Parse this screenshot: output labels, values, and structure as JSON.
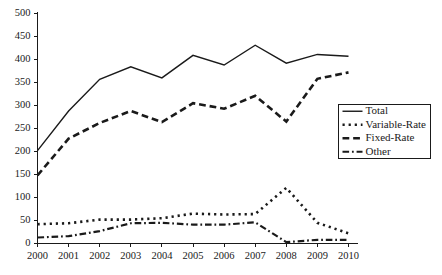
{
  "chart_data": {
    "type": "line",
    "title": "",
    "subtitle": "",
    "xlabel": "",
    "ylabel": "",
    "categories": [
      "2000",
      "2001",
      "2002",
      "2003",
      "2004",
      "2005",
      "2006",
      "2007",
      "2008",
      "2009",
      "2010"
    ],
    "x": [
      2000,
      2001,
      2002,
      2003,
      2004,
      2005,
      2006,
      2007,
      2008,
      2009,
      2010
    ],
    "ylim": [
      0,
      500
    ],
    "xlim": [
      2000,
      2010
    ],
    "yticks": [
      0,
      50,
      100,
      150,
      200,
      250,
      300,
      350,
      400,
      450,
      500
    ],
    "ytick_labels": [
      "0",
      "50",
      "100",
      "150",
      "200",
      "250",
      "300",
      "350",
      "400",
      "450",
      "500"
    ],
    "grid": false,
    "legend_position": "right",
    "series": [
      {
        "name": "Total",
        "dash": "solid",
        "width": 1.4,
        "color": "#1a1a1a",
        "values": [
          202,
          288,
          357,
          384,
          360,
          409,
          388,
          431,
          392,
          411,
          407
        ]
      },
      {
        "name": "Variable-Rate",
        "dash": "dotted",
        "width": 2.6,
        "color": "#1a1a1a",
        "values": [
          42,
          44,
          52,
          52,
          55,
          65,
          63,
          64,
          121,
          45,
          22
        ]
      },
      {
        "name": "Fixed-Rate",
        "dash": "dashed",
        "width": 2.6,
        "color": "#1a1a1a",
        "values": [
          148,
          228,
          262,
          288,
          264,
          305,
          293,
          321,
          265,
          358,
          372
        ]
      },
      {
        "name": "Other",
        "dash": "dashdot",
        "width": 2.2,
        "color": "#1a1a1a",
        "values": [
          13,
          16,
          27,
          44,
          45,
          41,
          41,
          46,
          3,
          8,
          8
        ]
      }
    ]
  },
  "legend": {
    "entries": [
      {
        "label": "Total"
      },
      {
        "label": "Variable-Rate"
      },
      {
        "label": "Fixed-Rate"
      },
      {
        "label": "Other"
      }
    ]
  }
}
